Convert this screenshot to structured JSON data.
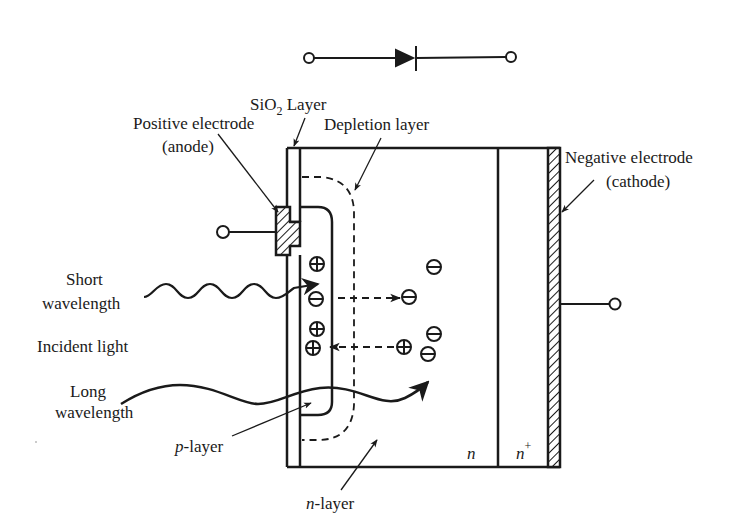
{
  "diagram": {
    "symbol": "diode-symbol",
    "labels": {
      "sio2_pre": "SiO",
      "sio2_sub": "2",
      "sio2_post": " Layer",
      "anode_line1": "Positive electrode",
      "anode_line2": "(anode)",
      "depletion": "Depletion layer",
      "cathode_line1": "Negative electrode",
      "cathode_line2": "(cathode)",
      "short_line1": "Short",
      "short_line2": "wavelength",
      "incident": "Incident light",
      "long_line1": "Long",
      "long_line2": "wavelength",
      "p_layer_it": "p",
      "p_layer_rest": "-layer",
      "n_layer_it": "n",
      "n_layer_rest": "-layer",
      "n_region": "n",
      "nplus_region": "n",
      "nplus_sup": "+"
    },
    "charges": {
      "plus": "⊕",
      "minus": "⊖"
    },
    "colors": {
      "ink": "#1a1a1a",
      "background": "#ffffff"
    }
  }
}
